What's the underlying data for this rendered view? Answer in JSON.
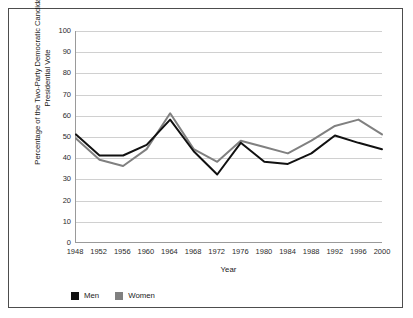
{
  "chart_data": {
    "type": "line",
    "title": "",
    "xlabel": "Year",
    "ylabel": "Percentage of the Two-Party Democratic Candidate Presidential Vote",
    "ylabel_lines": [
      "Percentage of the Two-Party Democratic Candidate",
      "Presidential Vote"
    ],
    "categories": [
      1948,
      1952,
      1956,
      1960,
      1964,
      1968,
      1972,
      1976,
      1980,
      1984,
      1988,
      1992,
      1996,
      2000
    ],
    "x_tick_labels": [
      "1948",
      "1952",
      "1956",
      "1960",
      "1964",
      "1968",
      "1972",
      "1976",
      "1980",
      "1984",
      "1988",
      "1992",
      "1996",
      "2000"
    ],
    "y_tick_labels": [
      "0",
      "10",
      "20",
      "30",
      "40",
      "50",
      "60",
      "70",
      "80",
      "90",
      "100"
    ],
    "y_ticks": [
      0,
      10,
      20,
      30,
      40,
      50,
      60,
      70,
      80,
      90,
      100
    ],
    "ylim": [
      0,
      100
    ],
    "grid": "horizontal",
    "legend_position": "below-axis-left",
    "series": [
      {
        "name": "Men",
        "color": "#111111",
        "values": [
          51,
          41,
          41,
          46,
          58,
          43,
          32,
          47,
          38,
          37,
          42,
          50.5,
          47,
          44
        ]
      },
      {
        "name": "Women",
        "color": "#808080",
        "values": [
          49,
          39,
          36,
          44,
          61,
          44,
          38,
          48,
          45,
          42,
          48,
          55,
          58,
          51
        ]
      }
    ]
  },
  "legend": {
    "items": [
      {
        "label": "Men",
        "color": "#111111"
      },
      {
        "label": "Women",
        "color": "#808080"
      }
    ]
  },
  "colors": {
    "men": "#111111",
    "women": "#808080",
    "grid": "#d0d0d0",
    "axis": "#9a9a9a",
    "border": "#4d4d4d",
    "background": "#ffffff"
  }
}
